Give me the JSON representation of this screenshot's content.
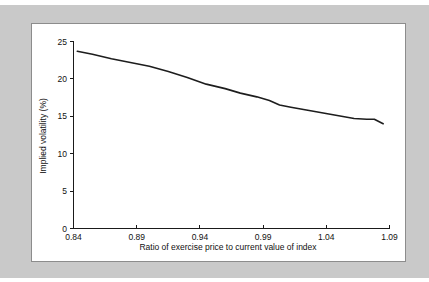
{
  "figure": {
    "background_color": "#c9c9c9",
    "panel_color": "#ffffff",
    "panel_border_color": "#8c8c8c",
    "line_color": "#1d1d1d",
    "text_color": "#111111"
  },
  "chart_data": {
    "type": "line",
    "title": "",
    "subtitle": "",
    "xlabel": "Ratio of exercise price to current value of index",
    "ylabel": "Implied volatility (%)",
    "xlim": [
      0.84,
      1.09
    ],
    "ylim": [
      0,
      25
    ],
    "grid": false,
    "legend_position": "none",
    "xticks": [
      "0.84",
      "0.89",
      "0.94",
      "0.99",
      "1.04",
      "1.09"
    ],
    "xtick_values": [
      0.84,
      0.89,
      0.94,
      0.99,
      1.04,
      1.09
    ],
    "yticks": [
      "0",
      "5",
      "10",
      "15",
      "20",
      "25"
    ],
    "ytick_values": [
      0,
      5,
      10,
      15,
      20,
      25
    ],
    "series": [
      {
        "name": "Implied volatility",
        "x": [
          0.843,
          0.855,
          0.87,
          0.885,
          0.9,
          0.915,
          0.93,
          0.945,
          0.96,
          0.972,
          0.985,
          0.995,
          1.003,
          1.012,
          1.022,
          1.032,
          1.042,
          1.052,
          1.062,
          1.072,
          1.078,
          1.085
        ],
        "y": [
          23.7,
          23.3,
          22.7,
          22.2,
          21.7,
          21.0,
          20.2,
          19.3,
          18.7,
          18.1,
          17.6,
          17.1,
          16.5,
          16.2,
          15.9,
          15.6,
          15.3,
          15.0,
          14.7,
          14.6,
          14.6,
          14.0
        ]
      }
    ]
  }
}
